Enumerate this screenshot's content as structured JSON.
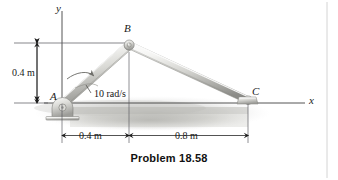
{
  "figure": {
    "caption": "Problem 18.58",
    "axes": {
      "y_label": "y",
      "x_label": "x"
    },
    "points": [
      {
        "id": "A",
        "label": "A",
        "x": 0.0,
        "y": 0.0,
        "type": "pin-support"
      },
      {
        "id": "B",
        "label": "B",
        "x": 0.4,
        "y": 0.4,
        "type": "pin-joint"
      },
      {
        "id": "C",
        "label": "C",
        "x": 1.2,
        "y": 0.0,
        "type": "slider"
      }
    ],
    "links": [
      {
        "from": "A",
        "to": "B",
        "name": "link-AB"
      },
      {
        "from": "B",
        "to": "C",
        "name": "link-BC"
      }
    ],
    "annotations": {
      "angular_velocity": "10 rad/s"
    },
    "dimensions": [
      {
        "name": "height-AB",
        "label": "0.4 m",
        "orientation": "vertical"
      },
      {
        "name": "horizontal-AB",
        "label": "0.4 m",
        "orientation": "horizontal"
      },
      {
        "name": "horizontal-BC",
        "label": "0.8 m",
        "orientation": "horizontal"
      }
    ]
  },
  "colors": {
    "ink": "#1a1a1a",
    "bar_light": "#f2f2f0",
    "bar_mid": "#cfcfcb",
    "bar_dark": "#9a9a96",
    "shadow": "#b8b8b4",
    "border": "#d8d8d8"
  }
}
